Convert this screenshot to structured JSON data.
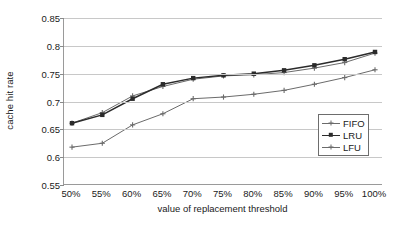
{
  "chart_data": {
    "type": "line",
    "title": "",
    "xlabel": "value of replacement threshold",
    "ylabel": "cache hit rate",
    "categories": [
      "50%",
      "55%",
      "60%",
      "65%",
      "70%",
      "75%",
      "80%",
      "85%",
      "90%",
      "95%",
      "100%"
    ],
    "x_tick_labels": [
      "50%",
      "55%",
      "60%",
      "65%",
      "70%",
      "75%",
      "80%",
      "85%",
      "90%",
      "95%",
      "100%"
    ],
    "y_tick_labels": [
      "0.85",
      "0.8",
      "0.75",
      "0.7",
      "0.65",
      "0.6",
      "0.55"
    ],
    "y_ticks": [
      0.85,
      0.8,
      0.75,
      0.7,
      0.65,
      0.6,
      0.55
    ],
    "ylim": [
      0.55,
      0.85
    ],
    "grid": "horizontal",
    "legend_position": "inside-bottom-right",
    "series": [
      {
        "name": "FIFO",
        "color": "#6b6b6b",
        "marker": "cross",
        "values": [
          0.661,
          0.68,
          0.71,
          0.727,
          0.74,
          0.746,
          0.748,
          0.752,
          0.76,
          0.77,
          0.787
        ]
      },
      {
        "name": "LRU",
        "color": "#2b2b2b",
        "marker": "square",
        "values": [
          0.661,
          0.676,
          0.705,
          0.731,
          0.742,
          0.747,
          0.75,
          0.756,
          0.765,
          0.776,
          0.789
        ]
      },
      {
        "name": "LFU",
        "color": "#6b6b6b",
        "marker": "cross",
        "values": [
          0.618,
          0.625,
          0.658,
          0.678,
          0.705,
          0.708,
          0.713,
          0.72,
          0.731,
          0.743,
          0.757
        ]
      }
    ]
  },
  "legend": {
    "entries": [
      {
        "label": "FIFO"
      },
      {
        "label": "LRU"
      },
      {
        "label": "LFU"
      }
    ]
  }
}
